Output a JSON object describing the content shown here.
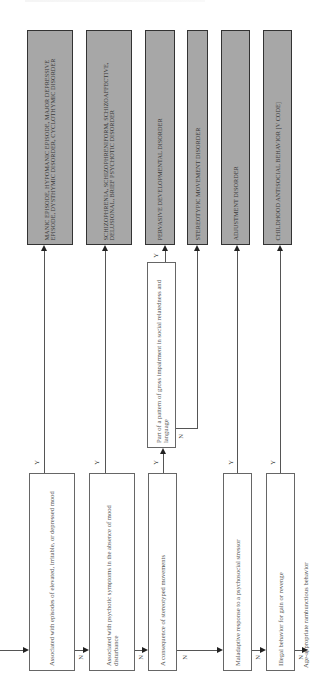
{
  "diagram": {
    "orientation": "rotated-90-ccw",
    "colors": {
      "outcome_fill": "#a7a7a7",
      "decision_fill": "#ffffff",
      "line": "#555555"
    },
    "outcomes": [
      {
        "id": "mood",
        "label": "MANIC EPISODE, HYPOMANIC EPISODE, MAJOR DEPRESSIVE EPISODE, DYSTHYMIC DISORDER, CYCLOTHYMIC DISORDER"
      },
      {
        "id": "psychotic",
        "label": "SCHIZOPHRENIA, SCHIZOPHRENIFORM, SCHIZOAFFECTIVE, DELUSIONAL, BRIEF PSYCHOTIC DISORDER"
      },
      {
        "id": "pdd",
        "label": "PERVASIVE DEVELOPMENTAL DISORDER"
      },
      {
        "id": "stereotypic",
        "label": "STEREOTYPIC MOVEMENT DISORDER"
      },
      {
        "id": "adjustment",
        "label": "ADJUSTMENT DISORDER"
      },
      {
        "id": "antisocial",
        "label": "CHILDHOOD ANTISOCIAL BEHAVIOR [V code]"
      }
    ],
    "decisions": [
      {
        "id": "q1",
        "label": "Associated with episodes of elevated, irritable, or depressed mood",
        "yes": "mood",
        "no": "q2"
      },
      {
        "id": "q2",
        "label": "Associated with psychotic symptoms in the absence of mood disturbance",
        "yes": "psychotic",
        "no": "q3"
      },
      {
        "id": "q3",
        "label": "A consequence of stereotyped movements",
        "yes": "q3b",
        "no": "q4"
      },
      {
        "id": "q3b",
        "label": "Part of a pattern of gross impairment in social relatedness and language",
        "yes": "pdd",
        "no": "stereotypic"
      },
      {
        "id": "q4",
        "label": "Maladaptive response to a psychosocial stressor",
        "yes": "adjustment",
        "no": "q5"
      },
      {
        "id": "q5",
        "label": "Illegal behavior for gain or revenge",
        "yes": "antisocial",
        "no": "terminal"
      }
    ],
    "terminal": "Age-appropriate rambunctious behavior",
    "yes_label": "Y",
    "no_label": "N"
  }
}
